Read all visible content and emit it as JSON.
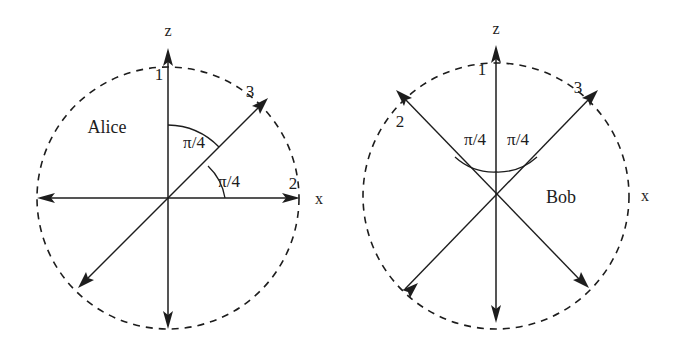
{
  "figure": {
    "background_color": "#ffffff",
    "stroke_color": "#1d1d1d",
    "width": 682,
    "height": 344
  },
  "panels": [
    {
      "id": "alice",
      "name": "Alice",
      "name_label": "Alice",
      "center": {
        "x": 168,
        "y": 198
      },
      "radius": 131,
      "axis_labels": {
        "z": "z",
        "x": "x"
      },
      "direction_labels": [
        "1",
        "2",
        "3"
      ],
      "angle_labels": [
        "π/4",
        "π/4"
      ],
      "directions": [
        {
          "label": "1",
          "angle_from_z_deg": 0,
          "description": "z-axis up"
        },
        {
          "label": "2",
          "angle_from_z_deg": 90,
          "description": "x-axis right"
        },
        {
          "label": "3",
          "angle_from_z_deg": 45,
          "description": "diagonal upper right"
        }
      ]
    },
    {
      "id": "bob",
      "name": "Bob",
      "name_label": "Bob",
      "center": {
        "x": 496,
        "y": 196
      },
      "radius": 133,
      "axis_labels": {
        "z": "z",
        "x": "x"
      },
      "direction_labels": [
        "1",
        "2",
        "3"
      ],
      "angle_labels": [
        "π/4",
        "π/4"
      ],
      "directions": [
        {
          "label": "1",
          "angle_from_z_deg": 0,
          "description": "z-axis up"
        },
        {
          "label": "2",
          "angle_from_z_deg": -45,
          "description": "diagonal upper left"
        },
        {
          "label": "3",
          "angle_from_z_deg": 45,
          "description": "diagonal upper right"
        }
      ]
    }
  ]
}
